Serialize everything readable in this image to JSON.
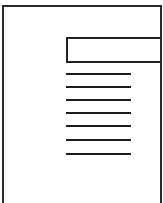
{
  "figure": {
    "type": "line-drawing",
    "stroke_color": "#222222",
    "background_color": "#ffffff",
    "header_box": {
      "label": ""
    },
    "text_lines": [
      {
        "y": 73
      },
      {
        "y": 86
      },
      {
        "y": 99
      },
      {
        "y": 112
      },
      {
        "y": 125
      },
      {
        "y": 139
      },
      {
        "y": 153
      }
    ]
  }
}
